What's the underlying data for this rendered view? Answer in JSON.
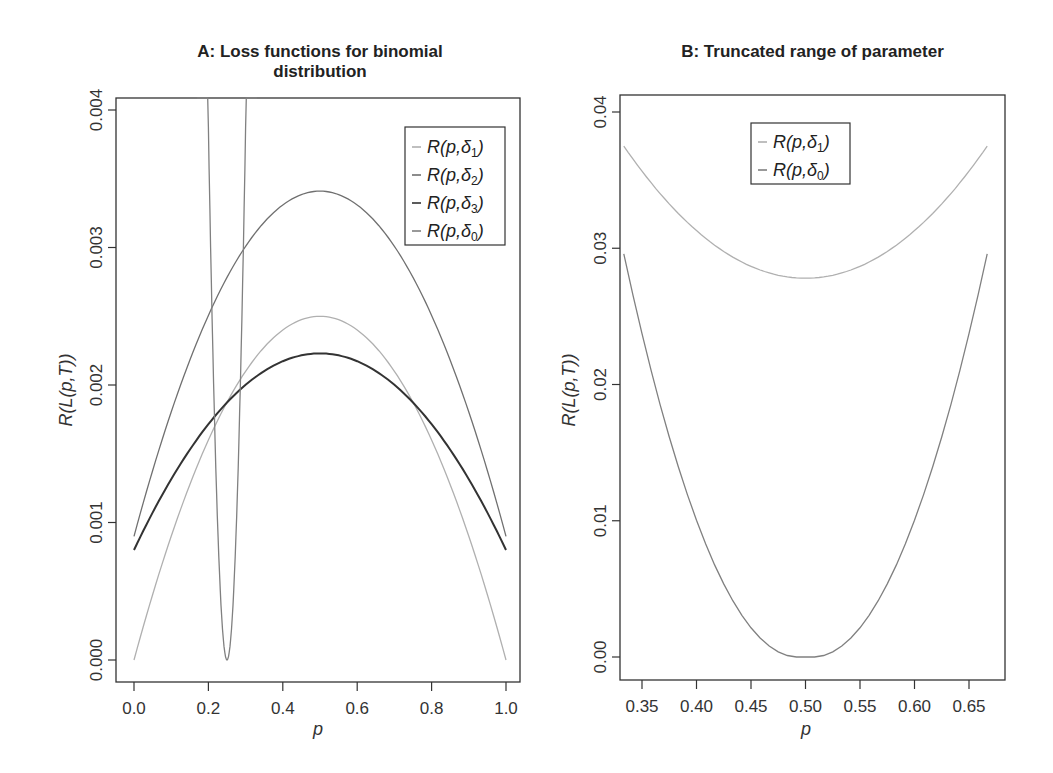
{
  "chart_data": [
    {
      "type": "line",
      "title": "A: Loss functions for binomial distribution",
      "title_lines": [
        "A: Loss functions for binomial",
        "distribution"
      ],
      "xlabel": "p",
      "ylabel": "R(L(p,T))",
      "xlim": [
        0.0,
        1.0
      ],
      "ylim": [
        0.0,
        0.004
      ],
      "xticks": [
        "0.0",
        "0.2",
        "0.4",
        "0.6",
        "0.8",
        "1.0"
      ],
      "yticks": [
        "0.000",
        "0.001",
        "0.002",
        "0.003",
        "0.004"
      ],
      "grid": false,
      "legend_position": "top-right",
      "x": [
        0.0,
        0.1,
        0.2,
        0.25,
        0.3,
        0.4,
        0.5,
        0.6,
        0.7,
        0.8,
        0.9,
        1.0
      ],
      "series": [
        {
          "name": "R(p,δ1)",
          "color": "#b0b0b0",
          "values": [
            0.0,
            0.0009,
            0.0016,
            0.001875,
            0.0021,
            0.0024,
            0.0025,
            0.0024,
            0.0021,
            0.0016,
            0.0009,
            0.0
          ]
        },
        {
          "name": "R(p,δ2)",
          "color": "#707070",
          "values": [
            0.0009,
            0.00188,
            0.00266,
            0.00294,
            0.0031,
            0.00336,
            0.00341,
            0.00336,
            0.0031,
            0.00266,
            0.00188,
            0.0009
          ]
        },
        {
          "name": "R(p,δ3)",
          "color": "#333333",
          "values": [
            0.0008,
            0.00137,
            0.00183,
            0.00196,
            0.00208,
            0.0022,
            0.00223,
            0.0022,
            0.00208,
            0.00183,
            0.00137,
            0.0008
          ]
        },
        {
          "name": "R(p,δ0)",
          "color": "#808080",
          "values": [
            null,
            null,
            0.0025,
            0.0,
            0.0025,
            null,
            null,
            null,
            null,
            null,
            null,
            null
          ]
        }
      ]
    },
    {
      "type": "line",
      "title": "B: Truncated range of parameter",
      "xlabel": "p",
      "ylabel": "R(L(p,T))",
      "xlim": [
        0.333,
        0.667
      ],
      "ylim": [
        0.0,
        0.04
      ],
      "xticks": [
        "0.35",
        "0.40",
        "0.45",
        "0.50",
        "0.55",
        "0.60",
        "0.65"
      ],
      "yticks": [
        "0.00",
        "0.01",
        "0.02",
        "0.03",
        "0.04"
      ],
      "grid": false,
      "legend_position": "top-center",
      "x": [
        0.333,
        0.35,
        0.4,
        0.45,
        0.5,
        0.55,
        0.6,
        0.65,
        0.667
      ],
      "series": [
        {
          "name": "R(p,δ1)",
          "color": "#b0b0b0",
          "values": [
            0.0375,
            0.0355,
            0.0315,
            0.0288,
            0.0278,
            0.0288,
            0.0315,
            0.0355,
            0.0375
          ]
        },
        {
          "name": "R(p,δ0)",
          "color": "#808080",
          "values": [
            0.029,
            0.024,
            0.011,
            0.0028,
            0.0,
            0.0028,
            0.011,
            0.024,
            0.029
          ]
        }
      ]
    }
  ],
  "panel_a": {
    "title_line1": "A: Loss functions for binomial",
    "title_line2": "distribution",
    "xlabel": "p",
    "ylabel": "R(L(p,T))",
    "xticks": [
      "0.0",
      "0.2",
      "0.4",
      "0.6",
      "0.8",
      "1.0"
    ],
    "yticks": [
      "0.000",
      "0.001",
      "0.002",
      "0.003",
      "0.004"
    ],
    "legend": [
      {
        "label": "R(p,δ",
        "sub": "1",
        "close": ")",
        "color": "#b0b0b0"
      },
      {
        "label": "R(p,δ",
        "sub": "2",
        "close": ")",
        "color": "#707070"
      },
      {
        "label": "R(p,δ",
        "sub": "3",
        "close": ")",
        "color": "#333333"
      },
      {
        "label": "R(p,δ",
        "sub": "0",
        "close": ")",
        "color": "#808080"
      }
    ]
  },
  "panel_b": {
    "title": "B: Truncated range of parameter",
    "xlabel": "p",
    "ylabel": "R(L(p,T))",
    "xticks": [
      "0.35",
      "0.40",
      "0.45",
      "0.50",
      "0.55",
      "0.60",
      "0.65"
    ],
    "yticks": [
      "0.00",
      "0.01",
      "0.02",
      "0.03",
      "0.04"
    ],
    "legend": [
      {
        "label": "R(p,δ",
        "sub": "1",
        "close": ")",
        "color": "#b0b0b0"
      },
      {
        "label": "R(p,δ",
        "sub": "0",
        "close": ")",
        "color": "#808080"
      }
    ]
  }
}
